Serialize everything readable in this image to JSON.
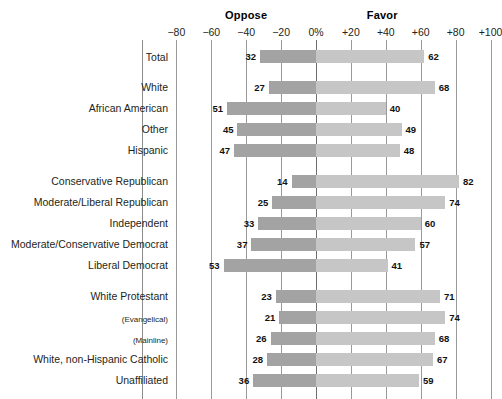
{
  "header": {
    "oppose_label": "Oppose",
    "favor_label": "Favor"
  },
  "axis": {
    "ticks": [
      "−80",
      "−60",
      "−40",
      "−20",
      "0%",
      "+20",
      "+40",
      "+60",
      "+80",
      "+100"
    ],
    "tick_values": [
      -80,
      -60,
      -40,
      -20,
      0,
      20,
      40,
      60,
      80,
      100
    ],
    "min": -100,
    "max": 100
  },
  "colors": {
    "oppose_bar": "#a3a3a3",
    "favor_bar": "#c6c6c6",
    "gridline": "#9a9a9a",
    "text": "#231f20",
    "background": "#ffffff"
  },
  "chart_data": {
    "type": "bar",
    "title": "",
    "subtitle": "",
    "xlabel": "",
    "ylabel": "",
    "xlim": [
      -100,
      100
    ],
    "grid": true,
    "orientation": "horizontal",
    "style": "diverging-bar",
    "legend_position": "top",
    "series": [
      {
        "name": "Oppose",
        "color": "#a3a3a3",
        "side": "left"
      },
      {
        "name": "Favor",
        "color": "#c6c6c6",
        "side": "right"
      }
    ],
    "categories": [
      "Total",
      "White",
      "African American",
      "Other",
      "Hispanic",
      "Conservative Republican",
      "Moderate/Liberal Republican",
      "Independent",
      "Moderate/Conservative Democrat",
      "Liberal Democrat",
      "White Protestant",
      "(Evangelical)",
      "(Mainline)",
      "White, non-Hispanic Catholic",
      "Unaffiliated"
    ],
    "oppose": [
      32,
      27,
      51,
      45,
      47,
      14,
      25,
      33,
      37,
      53,
      23,
      21,
      26,
      28,
      36
    ],
    "favor": [
      62,
      68,
      40,
      49,
      48,
      82,
      74,
      60,
      57,
      41,
      71,
      74,
      68,
      67,
      59
    ]
  },
  "rows": [
    {
      "label": "Total",
      "oppose": 32,
      "favor": 62,
      "group": 0,
      "small": false
    },
    {
      "label": "White",
      "oppose": 27,
      "favor": 68,
      "group": 1,
      "small": false
    },
    {
      "label": "African American",
      "oppose": 51,
      "favor": 40,
      "group": 1,
      "small": false
    },
    {
      "label": "Other",
      "oppose": 45,
      "favor": 49,
      "group": 1,
      "small": false
    },
    {
      "label": "Hispanic",
      "oppose": 47,
      "favor": 48,
      "group": 1,
      "small": false
    },
    {
      "label": "Conservative Republican",
      "oppose": 14,
      "favor": 82,
      "group": 2,
      "small": false
    },
    {
      "label": "Moderate/Liberal Republican",
      "oppose": 25,
      "favor": 74,
      "group": 2,
      "small": false
    },
    {
      "label": "Independent",
      "oppose": 33,
      "favor": 60,
      "group": 2,
      "small": false
    },
    {
      "label": "Moderate/Conservative Democrat",
      "oppose": 37,
      "favor": 57,
      "group": 2,
      "small": false
    },
    {
      "label": "Liberal Democrat",
      "oppose": 53,
      "favor": 41,
      "group": 2,
      "small": false
    },
    {
      "label": "White Protestant",
      "oppose": 23,
      "favor": 71,
      "group": 3,
      "small": false
    },
    {
      "label": "(Evangelical)",
      "oppose": 21,
      "favor": 74,
      "group": 3,
      "small": true
    },
    {
      "label": "(Mainline)",
      "oppose": 26,
      "favor": 68,
      "group": 3,
      "small": true
    },
    {
      "label": "White, non-Hispanic Catholic",
      "oppose": 28,
      "favor": 67,
      "group": 3,
      "small": false
    },
    {
      "label": "Unaffiliated",
      "oppose": 36,
      "favor": 59,
      "group": 3,
      "small": false
    }
  ]
}
